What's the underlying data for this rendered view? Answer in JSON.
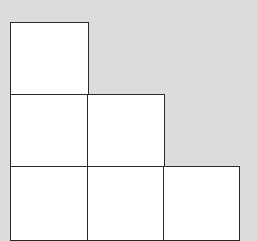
{
  "diagram": {
    "title": "",
    "background_color": "#dcdcdc",
    "cell_fill": "#ffffff",
    "line_color": "#2a2a2a",
    "rows": [
      {
        "row": 1,
        "cells": 1
      },
      {
        "row": 2,
        "cells": 2
      },
      {
        "row": 3,
        "cells": 3
      }
    ]
  }
}
